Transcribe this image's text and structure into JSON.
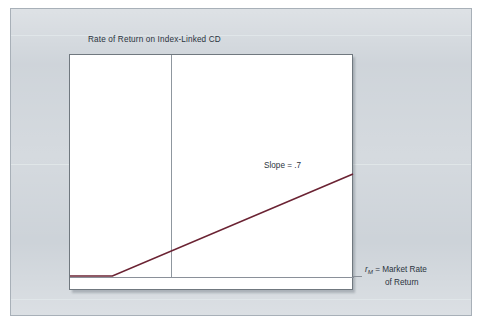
{
  "figure": {
    "title": "Rate of Return on Index-Linked CD",
    "slope_annotation": "Slope = .7",
    "axis_label_symbol": "r",
    "axis_label_subscript": "M",
    "axis_label_line1": "= Market Rate",
    "axis_label_line2": "of Return"
  },
  "colors": {
    "payoff_line": "#6b2333",
    "axis_line": "#8a9099",
    "divider_line": "#8f979f",
    "plot_border": "#70787f",
    "paper_background": "#ccd2d8",
    "plot_background": "#ffffff",
    "text": "#2b3440"
  },
  "chart_data": {
    "type": "line",
    "title": "Rate of Return on Index-Linked CD",
    "xlabel": "",
    "ylabel": "",
    "grid": false,
    "legend": null,
    "series": [
      {
        "name": "Index-Linked CD rate of return",
        "x": [
          0,
          0.15,
          0.15,
          1.0
        ],
        "y": [
          0.0,
          0.0,
          0.0,
          0.46
        ],
        "segments": [
          {
            "name": "flat floor",
            "x": [
              0,
              0.15
            ],
            "y": [
              0,
              0
            ],
            "slope": 0
          },
          {
            "name": "participation",
            "x": [
              0.15,
              1.0
            ],
            "y": [
              0,
              0.46
            ],
            "slope": 0.7
          }
        ]
      }
    ],
    "reference_lines": [
      {
        "name": "market-rate-axis",
        "orientation": "horizontal",
        "value": 0,
        "label": "rM = Market Rate of Return"
      },
      {
        "name": "strike-divider",
        "orientation": "vertical",
        "value": 0.15,
        "label": ""
      }
    ],
    "annotations": [
      {
        "text": "Slope = .7",
        "x": 0.68,
        "y": 0.3
      }
    ],
    "xlim": [
      0,
      1
    ],
    "ylim": [
      0,
      1
    ]
  }
}
